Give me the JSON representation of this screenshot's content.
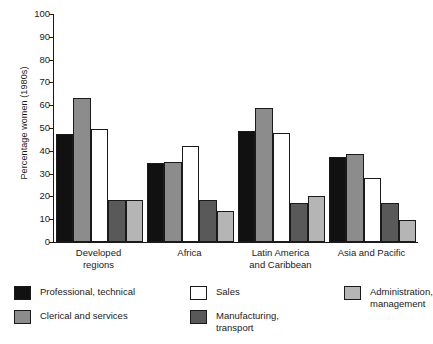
{
  "chart_data": {
    "type": "bar",
    "title": "",
    "subtitle": "",
    "xlabel": "",
    "ylabel": "Percentage women (1980s)",
    "ylim": [
      0,
      100
    ],
    "ytick_step": 10,
    "yticks": [
      "100",
      "90",
      "80",
      "70",
      "60",
      "50",
      "40",
      "30",
      "20",
      "10",
      "0"
    ],
    "grid": false,
    "legend_position": "bottom",
    "categories": [
      "Developed\nregions",
      "Africa",
      "Latin America\nand Caribbean",
      "Asia and Pacific"
    ],
    "series": [
      {
        "name": "Professional, technical",
        "color": "#111111",
        "values": [
          47.5,
          34.8,
          48.5,
          37.5
        ]
      },
      {
        "name": "Clerical and services",
        "color": "#8c8c8c",
        "values": [
          63.2,
          35.3,
          58.7,
          38.4
        ]
      },
      {
        "name": "Sales",
        "color": "#ffffff",
        "values": [
          49.6,
          42.1,
          47.6,
          28.2
        ]
      },
      {
        "name": "Manufacturing,\ntransport",
        "color": "#595959",
        "values": [
          18.6,
          18.4,
          17.3,
          17.1
        ]
      },
      {
        "name": "Administration,\nmanagement",
        "color": "#b5b5b5",
        "values": [
          18.6,
          13.4,
          20.1,
          9.8
        ]
      }
    ]
  },
  "axis": {
    "y_title": "Percentage women (1980s)",
    "tick_100": "100",
    "tick_90": "90",
    "tick_80": "80",
    "tick_70": "70",
    "tick_60": "60",
    "tick_50": "50",
    "tick_40": "40",
    "tick_30": "30",
    "tick_20": "20",
    "tick_10": "10",
    "tick_0": "0"
  },
  "categories": {
    "cat_0": "Developed\nregions",
    "cat_1": "Africa",
    "cat_2": "Latin America\nand Caribbean",
    "cat_3": "Asia and Pacific"
  },
  "legend": {
    "item_0": "Professional, technical",
    "item_1": "Clerical and services",
    "item_2": "Sales",
    "item_3": "Manufacturing,\ntransport",
    "item_4": "Administration,\nmanagement"
  }
}
